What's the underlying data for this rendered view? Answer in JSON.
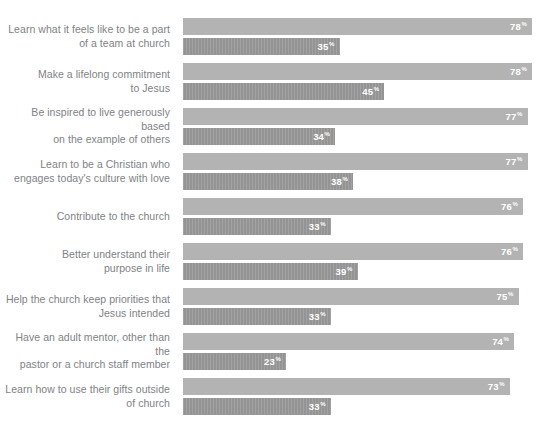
{
  "chart_data": {
    "type": "bar",
    "orientation": "horizontal",
    "title": "",
    "subtitle": "",
    "xlabel": "",
    "ylabel": "",
    "xlim": [
      0,
      80
    ],
    "grid": false,
    "legend": "none",
    "value_suffix": "%",
    "categories": [
      "Learn what it feels like to be a part\nof a team at church",
      "Make a lifelong commitment\nto Jesus",
      "Be inspired to live generously based\non the example of others",
      "Learn to be a Christian who\nengages today's culture with love",
      "Contribute to the church",
      "Better understand their\npurpose in life",
      "Help the church keep priorities that\nJesus intended",
      "Have an adult mentor, other than the\npastor or a church staff member",
      "Learn how to use their gifts outside\nof church"
    ],
    "series": [
      {
        "name": "series-1",
        "color": "#b3b3b3",
        "values": [
          78,
          78,
          77,
          77,
          76,
          76,
          75,
          74,
          73
        ]
      },
      {
        "name": "series-2",
        "color": "#949494",
        "values": [
          35,
          45,
          34,
          38,
          33,
          39,
          33,
          23,
          33
        ]
      }
    ]
  }
}
